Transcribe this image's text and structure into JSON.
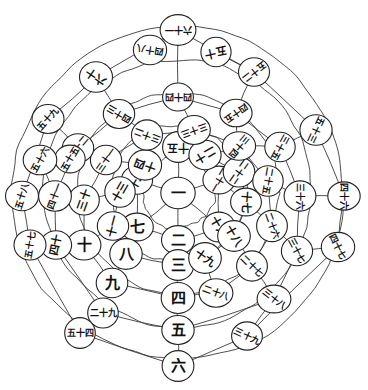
{
  "figure": {
    "title": "",
    "type": "radial-number-spiral",
    "background_color": "#ffffff",
    "line_color": "#3a3a3a",
    "node_fill": "#ffffff",
    "node_stroke": "#222222",
    "text_color": "#111111",
    "center": {
      "x": 178,
      "y": 193
    },
    "ring_count": 6,
    "spoke_count": 12
  },
  "chart_data": {
    "type": "scatter",
    "title": "",
    "xlabel": "",
    "ylabel": "",
    "grid": true,
    "legend": null,
    "rings": [
      {
        "index": 0,
        "radius": 0,
        "node_count": 1,
        "label": "中心"
      },
      {
        "index": 1,
        "radius": 36,
        "node_count": 6,
        "label": "第一圈"
      },
      {
        "index": 2,
        "radius": 68,
        "node_count": 12,
        "label": "第二圈"
      },
      {
        "index": 3,
        "radius": 101,
        "node_count": 12,
        "label": "第三圈"
      },
      {
        "index": 4,
        "radius": 134,
        "node_count": 12,
        "label": "第四圈"
      },
      {
        "index": 5,
        "radius": 166,
        "node_count": 12,
        "label": "第五圈"
      }
    ],
    "nodes": [
      {
        "id": "n1",
        "value": 1,
        "label": "一",
        "ring": 0,
        "angle_deg": 0,
        "x": 178,
        "y": 193,
        "r": 17,
        "rot": 0
      },
      {
        "id": "n2",
        "value": 2,
        "label": "二",
        "ring": 1,
        "angle_deg": 90,
        "x": 178,
        "y": 240,
        "r": 16,
        "rot": 0
      },
      {
        "id": "n7",
        "value": 7,
        "label": "七",
        "ring": 1,
        "angle_deg": 150,
        "x": 137,
        "y": 227,
        "r": 16,
        "rot": 0
      },
      {
        "id": "n12",
        "value": 12,
        "label": "十二",
        "ring": 1,
        "angle_deg": 210,
        "x": 137,
        "y": 180,
        "r": 16,
        "rot": -60
      },
      {
        "id": "n15",
        "value": 15,
        "label": "十五",
        "ring": 1,
        "angle_deg": 270,
        "x": 178,
        "y": 147,
        "r": 16,
        "rot": 180
      },
      {
        "id": "n21",
        "value": 21,
        "label": "二十一",
        "ring": 1,
        "angle_deg": 330,
        "x": 219,
        "y": 180,
        "r": 16,
        "rot": 120
      },
      {
        "id": "n16",
        "value": 16,
        "label": "十六",
        "ring": 1,
        "angle_deg": 30,
        "x": 219,
        "y": 227,
        "r": 16,
        "rot": 60
      },
      {
        "id": "n3",
        "value": 3,
        "label": "三",
        "ring": 2,
        "angle_deg": 90,
        "x": 178,
        "y": 265,
        "r": 16,
        "rot": 0
      },
      {
        "id": "n8",
        "value": 8,
        "label": "八",
        "ring": 2,
        "angle_deg": 150,
        "x": 126,
        "y": 254,
        "r": 16,
        "rot": 0
      },
      {
        "id": "n11",
        "value": 11,
        "label": "十一",
        "ring": 2,
        "angle_deg": 180,
        "x": 113,
        "y": 226,
        "r": 16,
        "rot": -75
      },
      {
        "id": "n13",
        "value": 13,
        "label": "十三",
        "ring": 2,
        "angle_deg": 215,
        "x": 120,
        "y": 192,
        "r": 16,
        "rot": -60
      },
      {
        "id": "n14",
        "value": 14,
        "label": "十四",
        "ring": 2,
        "angle_deg": 250,
        "x": 145,
        "y": 165,
        "r": 16,
        "rot": 200
      },
      {
        "id": "n20",
        "value": 20,
        "label": "二十",
        "ring": 2,
        "angle_deg": 290,
        "x": 205,
        "y": 155,
        "r": 16,
        "rot": 150
      },
      {
        "id": "n22",
        "value": 22,
        "label": "二十二",
        "ring": 2,
        "angle_deg": 325,
        "x": 239,
        "y": 172,
        "r": 16,
        "rot": 125
      },
      {
        "id": "n17",
        "value": 17,
        "label": "十七",
        "ring": 2,
        "angle_deg": 5,
        "x": 246,
        "y": 202,
        "r": 16,
        "rot": 95
      },
      {
        "id": "n18",
        "value": 18,
        "label": "十八",
        "ring": 2,
        "angle_deg": 40,
        "x": 234,
        "y": 236,
        "r": 16,
        "rot": 60
      },
      {
        "id": "n19",
        "value": 19,
        "label": "十九",
        "ring": 2,
        "angle_deg": 65,
        "x": 205,
        "y": 258,
        "r": 16,
        "rot": 35
      },
      {
        "id": "n4",
        "value": 4,
        "label": "四",
        "ring": 3,
        "angle_deg": 90,
        "x": 178,
        "y": 298,
        "r": 16,
        "rot": 0
      },
      {
        "id": "n9",
        "value": 9,
        "label": "九",
        "ring": 3,
        "angle_deg": 140,
        "x": 112,
        "y": 283,
        "r": 16,
        "rot": 0
      },
      {
        "id": "n10",
        "value": 10,
        "label": "十",
        "ring": 3,
        "angle_deg": 170,
        "x": 84,
        "y": 245,
        "r": 16,
        "rot": 0
      },
      {
        "id": "n30",
        "value": 30,
        "label": "三十",
        "ring": 3,
        "angle_deg": 200,
        "x": 84,
        "y": 200,
        "r": 16,
        "rot": -70
      },
      {
        "id": "n31",
        "value": 31,
        "label": "三十一",
        "ring": 3,
        "angle_deg": 232,
        "x": 106,
        "y": 160,
        "r": 16,
        "rot": -55
      },
      {
        "id": "n32",
        "value": 32,
        "label": "三十二",
        "ring": 3,
        "angle_deg": 263,
        "x": 147,
        "y": 135,
        "r": 16,
        "rot": 200
      },
      {
        "id": "n33",
        "value": 33,
        "label": "三十三",
        "ring": 3,
        "angle_deg": 290,
        "x": 194,
        "y": 130,
        "r": 16,
        "rot": 160
      },
      {
        "id": "n34",
        "value": 34,
        "label": "三十四",
        "ring": 3,
        "angle_deg": 320,
        "x": 239,
        "y": 146,
        "r": 16,
        "rot": 130
      },
      {
        "id": "n25",
        "value": 25,
        "label": "二十五",
        "ring": 3,
        "angle_deg": 350,
        "x": 268,
        "y": 181,
        "r": 16,
        "rot": 100
      },
      {
        "id": "n26",
        "value": 26,
        "label": "二十六",
        "ring": 3,
        "angle_deg": 22,
        "x": 272,
        "y": 226,
        "r": 16,
        "rot": 70
      },
      {
        "id": "n27",
        "value": 27,
        "label": "二十七",
        "ring": 3,
        "angle_deg": 50,
        "x": 252,
        "y": 266,
        "r": 16,
        "rot": 45
      },
      {
        "id": "n28",
        "value": 28,
        "label": "二十八",
        "ring": 3,
        "angle_deg": 72,
        "x": 216,
        "y": 293,
        "r": 16,
        "rot": 20
      },
      {
        "id": "n5",
        "value": 5,
        "label": "五",
        "ring": 4,
        "angle_deg": 90,
        "x": 178,
        "y": 330,
        "r": 16,
        "rot": 0
      },
      {
        "id": "n29",
        "value": 29,
        "label": "二十九",
        "ring": 4,
        "angle_deg": 135,
        "x": 103,
        "y": 313,
        "r": 16,
        "rot": 0
      },
      {
        "id": "n40",
        "value": 40,
        "label": "四十",
        "ring": 4,
        "angle_deg": 168,
        "x": 56,
        "y": 245,
        "r": 16,
        "rot": -78
      },
      {
        "id": "n41",
        "value": 41,
        "label": "四十一",
        "ring": 4,
        "angle_deg": 196,
        "x": 55,
        "y": 196,
        "r": 16,
        "rot": -70
      },
      {
        "id": "n42",
        "value": 42,
        "label": "四十二",
        "ring": 4,
        "angle_deg": 224,
        "x": 78,
        "y": 148,
        "r": 16,
        "rot": -50
      },
      {
        "id": "n43",
        "value": 43,
        "label": "四十三",
        "ring": 4,
        "angle_deg": 252,
        "x": 119,
        "y": 114,
        "r": 16,
        "rot": 210
      },
      {
        "id": "n44",
        "value": 44,
        "label": "四十四",
        "ring": 4,
        "angle_deg": 278,
        "x": 178,
        "y": 97,
        "r": 16,
        "rot": 180
      },
      {
        "id": "n45",
        "value": 45,
        "label": "四十五",
        "ring": 4,
        "angle_deg": 304,
        "x": 236,
        "y": 113,
        "r": 16,
        "rot": 145
      },
      {
        "id": "n35",
        "value": 35,
        "label": "三十五",
        "ring": 4,
        "angle_deg": 332,
        "x": 280,
        "y": 147,
        "r": 16,
        "rot": 118
      },
      {
        "id": "n36",
        "value": 36,
        "label": "三十六",
        "ring": 4,
        "angle_deg": 358,
        "x": 300,
        "y": 196,
        "r": 16,
        "rot": 90
      },
      {
        "id": "n37",
        "value": 37,
        "label": "三十七",
        "ring": 4,
        "angle_deg": 25,
        "x": 297,
        "y": 251,
        "r": 16,
        "rot": 62
      },
      {
        "id": "n38",
        "value": 38,
        "label": "三十八",
        "ring": 4,
        "angle_deg": 52,
        "x": 274,
        "y": 299,
        "r": 16,
        "rot": 38
      },
      {
        "id": "n6",
        "value": 6,
        "label": "六",
        "ring": 5,
        "angle_deg": 90,
        "x": 178,
        "y": 366,
        "r": 16,
        "rot": 0
      },
      {
        "id": "n39",
        "value": 39,
        "label": "三十九",
        "ring": 5,
        "angle_deg": 62,
        "x": 247,
        "y": 336,
        "r": 16,
        "rot": 25
      },
      {
        "id": "n54",
        "value": 54,
        "label": "五十四",
        "ring": 5,
        "angle_deg": 136,
        "x": 80,
        "y": 333,
        "r": 16,
        "rot": 0
      },
      {
        "id": "n57",
        "value": 57,
        "label": "五十七",
        "ring": 5,
        "angle_deg": 162,
        "x": 30,
        "y": 245,
        "r": 16,
        "rot": -80
      },
      {
        "id": "n58",
        "value": 58,
        "label": "五十八",
        "ring": 5,
        "angle_deg": 190,
        "x": 22,
        "y": 196,
        "r": 16,
        "rot": -72
      },
      {
        "id": "n59",
        "value": 59,
        "label": "五十九",
        "ring": 5,
        "angle_deg": 218,
        "x": 48,
        "y": 119,
        "r": 16,
        "rot": -48
      },
      {
        "id": "n60",
        "value": 60,
        "label": "六十",
        "ring": 5,
        "angle_deg": 246,
        "x": 96,
        "y": 77,
        "r": 16,
        "rot": 215
      },
      {
        "id": "n61",
        "value": 61,
        "label": "六十一",
        "ring": 5,
        "angle_deg": 272,
        "x": 178,
        "y": 30,
        "r": 17,
        "rot": 180
      },
      {
        "id": "n52",
        "value": 52,
        "label": "五十二",
        "ring": 5,
        "angle_deg": 300,
        "x": 254,
        "y": 72,
        "r": 16,
        "rot": 142
      },
      {
        "id": "n53",
        "value": 53,
        "label": "五十三",
        "ring": 5,
        "angle_deg": 330,
        "x": 316,
        "y": 130,
        "r": 16,
        "rot": 115
      },
      {
        "id": "n46",
        "value": 46,
        "label": "四十六",
        "ring": 5,
        "angle_deg": 356,
        "x": 344,
        "y": 196,
        "r": 16,
        "rot": 90
      },
      {
        "id": "n47",
        "value": 47,
        "label": "四十七",
        "ring": 5,
        "angle_deg": 24,
        "x": 338,
        "y": 247,
        "r": 16,
        "rot": 64
      }
    ],
    "left_outer_nodes": [
      {
        "id": "n55",
        "value": 55,
        "label": "五十五",
        "x": 70,
        "y": 159,
        "r": 16,
        "rot": -60
      },
      {
        "id": "n56",
        "value": 56,
        "label": "五十六",
        "x": 40,
        "y": 160,
        "r": 16,
        "rot": -62
      },
      {
        "id": "n48",
        "value": 48,
        "label": "四十八",
        "x": 150,
        "y": 50,
        "r": 16,
        "rot": 190
      },
      {
        "id": "n50",
        "value": 50,
        "label": "五十",
        "x": 216,
        "y": 52,
        "r": 16,
        "rot": 168
      }
    ]
  },
  "a11y": {
    "figure_role": "diagram",
    "alt": "Concentric ring diagram of Chinese numerals radiating from a central 一"
  }
}
